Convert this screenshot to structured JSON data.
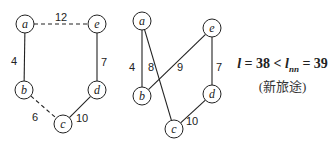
{
  "figure": {
    "graphs": [
      {
        "id": "graph-1",
        "nodes": [
          {
            "id": "a",
            "label": "a",
            "x": 25,
            "y": 24
          },
          {
            "id": "e",
            "label": "e",
            "x": 97,
            "y": 24
          },
          {
            "id": "b",
            "label": "b",
            "x": 24,
            "y": 90
          },
          {
            "id": "d",
            "label": "d",
            "x": 97,
            "y": 90
          },
          {
            "id": "c",
            "label": "c",
            "x": 63,
            "y": 124
          }
        ],
        "edges": [
          {
            "from": "a",
            "to": "e",
            "weight": "12",
            "style": "dashed",
            "lx": 61,
            "ly": 17
          },
          {
            "from": "a",
            "to": "b",
            "weight": "4",
            "style": "solid",
            "lx": 14,
            "ly": 61
          },
          {
            "from": "e",
            "to": "d",
            "weight": "7",
            "style": "solid",
            "lx": 104,
            "ly": 62
          },
          {
            "from": "b",
            "to": "c",
            "weight": "6",
            "style": "dashed",
            "lx": 35,
            "ly": 117
          },
          {
            "from": "d",
            "to": "c",
            "weight": "10",
            "style": "solid",
            "lx": 82,
            "ly": 118
          }
        ]
      },
      {
        "id": "graph-2",
        "nodes": [
          {
            "id": "a",
            "label": "a",
            "x": 142,
            "y": 21
          },
          {
            "id": "e",
            "label": "e",
            "x": 212,
            "y": 28
          },
          {
            "id": "b",
            "label": "b",
            "x": 142,
            "y": 96
          },
          {
            "id": "d",
            "label": "d",
            "x": 212,
            "y": 94
          },
          {
            "id": "c",
            "label": "c",
            "x": 174,
            "y": 129
          }
        ],
        "edges": [
          {
            "from": "a",
            "to": "b",
            "weight": "4",
            "style": "solid",
            "lx": 132,
            "ly": 67
          },
          {
            "from": "a",
            "to": "c",
            "weight": "8",
            "style": "solid",
            "lx": 151,
            "ly": 67
          },
          {
            "from": "e",
            "to": "b",
            "weight": "9",
            "style": "solid",
            "lx": 180,
            "ly": 67
          },
          {
            "from": "e",
            "to": "d",
            "weight": "7",
            "style": "solid",
            "lx": 219,
            "ly": 67
          },
          {
            "from": "d",
            "to": "c",
            "weight": "10",
            "style": "solid",
            "lx": 192,
            "ly": 121
          }
        ]
      }
    ],
    "formula": {
      "l_symbol": "l",
      "eq1": " = 38 < ",
      "lnn_symbol": "l",
      "lnn_sub": "nn",
      "eq2": " = 39",
      "caption": "(新旅途)"
    }
  }
}
